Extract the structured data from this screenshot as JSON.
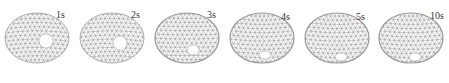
{
  "figure": {
    "mesh_color": "#8a8a8a",
    "hole_color": "#ffffff",
    "frames": [
      {
        "label": "1s",
        "shape": "dome",
        "hole": {
          "cx": 46,
          "cy": 41,
          "rx": 7,
          "ry": 7
        }
      },
      {
        "label": "2s",
        "shape": "dome",
        "hole": {
          "cx": 45,
          "cy": 43,
          "rx": 7,
          "ry": 7
        }
      },
      {
        "label": "3s",
        "shape": "transition",
        "hole": {
          "cx": 43,
          "cy": 50,
          "rx": 6,
          "ry": 5
        }
      },
      {
        "label": "4s",
        "shape": "bowl",
        "hole": {
          "cx": 40,
          "cy": 55,
          "rx": 6,
          "ry": 4
        }
      },
      {
        "label": "5s",
        "shape": "bowl",
        "hole": {
          "cx": 41,
          "cy": 57,
          "rx": 6,
          "ry": 4
        }
      },
      {
        "label": "10s",
        "shape": "bowl",
        "hole": {
          "cx": 41,
          "cy": 57,
          "rx": 6,
          "ry": 4
        }
      }
    ]
  }
}
